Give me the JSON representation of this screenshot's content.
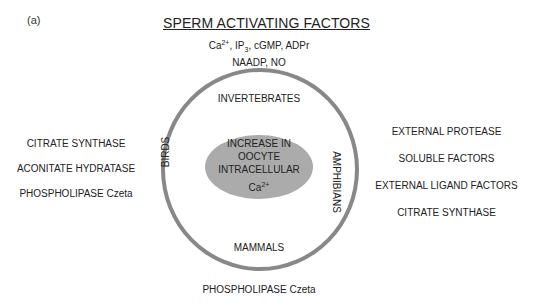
{
  "panel_label": "(a)",
  "title": "SPERM ACTIVATING FACTORS",
  "factors": {
    "line1_parts": [
      "Ca",
      "2+",
      ", IP",
      "3",
      ", cGMP, ADPr"
    ],
    "line2": "NAADP, NO"
  },
  "center": {
    "line1": "INCREASE IN",
    "line2": "OOCYTE",
    "line3": "INTRACELLULAR",
    "ion": "Ca",
    "ion_charge": "2+"
  },
  "groups": {
    "top": "INVERTEBRATES",
    "bottom": "MAMMALS",
    "left": "BIRDS",
    "right": "AMPHIBIANS"
  },
  "birds_factors": [
    "CITRATE SYNTHASE",
    "ACONITATE HYDRATASE",
    "PHOSPHOLIPASE Czeta"
  ],
  "amphibian_factors": [
    "EXTERNAL PROTEASE",
    "SOLUBLE FACTORS",
    "EXTERNAL LIGAND FACTORS",
    "CITRATE SYNTHASE"
  ],
  "mammal_factors": [
    "PHOSPHOLIPASE Czeta"
  ],
  "colors": {
    "ring": "#888888",
    "ellipse_fill": "#ababab",
    "text": "#222222"
  }
}
